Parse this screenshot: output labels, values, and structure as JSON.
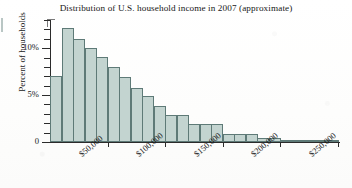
{
  "figure": {
    "title": "Distribution of U.S. household income in 2007 (approximate)",
    "bar_fill": "#c3d4d0",
    "bar_stroke": "#5e7a77",
    "axis_color": "#2b2b2b"
  },
  "yaxis": {
    "label": "Percent of households",
    "ticks": [
      {
        "value": 0,
        "label": "0"
      },
      {
        "value": 1,
        "label": ""
      },
      {
        "value": 2,
        "label": ""
      },
      {
        "value": 3,
        "label": ""
      },
      {
        "value": 4,
        "label": ""
      },
      {
        "value": 5,
        "label": "5%"
      },
      {
        "value": 6,
        "label": ""
      },
      {
        "value": 7,
        "label": ""
      },
      {
        "value": 8,
        "label": ""
      },
      {
        "value": 9,
        "label": ""
      },
      {
        "value": 10,
        "label": "10%"
      },
      {
        "value": 11,
        "label": ""
      },
      {
        "value": 12,
        "label": ""
      },
      {
        "value": 13,
        "label": ""
      }
    ]
  },
  "xaxis": {
    "ticks": [
      {
        "value": 50000,
        "label": "$50,000"
      },
      {
        "value": 100000,
        "label": "$100,000"
      },
      {
        "value": 150000,
        "label": "$150,000"
      },
      {
        "value": 200000,
        "label": "$200,000"
      },
      {
        "value": 250000,
        "label": "$250,000"
      }
    ]
  },
  "chart_data": {
    "type": "bar",
    "title": "Distribution of U.S. household income in 2007 (approximate)",
    "subtitle": "",
    "xlabel": "",
    "ylabel": "Percent of households",
    "xlim": [
      0,
      250000
    ],
    "ylim": [
      0,
      13
    ],
    "grid": false,
    "legend": null,
    "bin_width": 10000,
    "bin_edges": [
      0,
      10000,
      20000,
      30000,
      40000,
      50000,
      60000,
      70000,
      80000,
      90000,
      100000,
      110000,
      120000,
      130000,
      140000,
      150000,
      160000,
      170000,
      180000,
      190000,
      200000,
      210000,
      220000,
      230000,
      240000,
      250000
    ],
    "categories": [
      "$0–$10,000",
      "$10,000–$20,000",
      "$20,000–$30,000",
      "$30,000–$40,000",
      "$40,000–$50,000",
      "$50,000–$60,000",
      "$60,000–$70,000",
      "$70,000–$80,000",
      "$80,000–$90,000",
      "$90,000–$100,000",
      "$100,000–$110,000",
      "$110,000–$120,000",
      "$120,000–$130,000",
      "$130,000–$140,000",
      "$140,000–$150,000",
      "$150,000–$160,000",
      "$160,000–$170,000",
      "$170,000–$180,000",
      "$180,000–$190,000",
      "$190,000–$200,000",
      "$200,000–$210,000",
      "$210,000–$220,000",
      "$220,000–$230,000",
      "$230,000–$240,000",
      "$240,000–$250,000"
    ],
    "values": [
      7.0,
      12.2,
      11.0,
      10.0,
      9.1,
      8.0,
      6.9,
      5.8,
      4.9,
      3.8,
      2.9,
      2.9,
      1.9,
      1.9,
      1.9,
      0.9,
      0.9,
      0.9,
      0.4,
      0.4,
      0.2,
      0.2,
      0.2,
      0.2,
      0.2
    ],
    "yticks": [
      0,
      5,
      10
    ],
    "ytick_labels": [
      "0",
      "5%",
      "10%"
    ],
    "xticks": [
      50000,
      100000,
      150000,
      200000,
      250000
    ],
    "xtick_labels": [
      "$50,000",
      "$100,000",
      "$150,000",
      "$200,000",
      "$250,000"
    ]
  }
}
